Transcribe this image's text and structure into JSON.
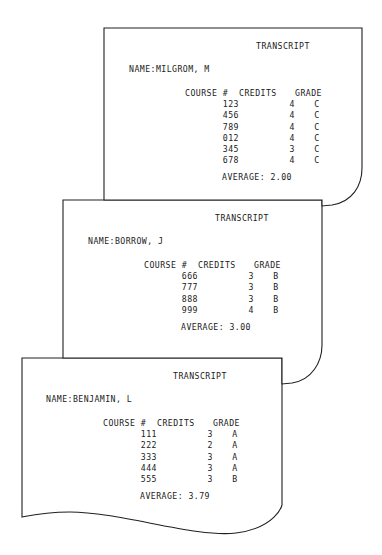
{
  "document": {
    "kind": "stacked-transcript-pages",
    "page_count": 3,
    "background_color": "#ffffff",
    "ink_color": "#202020"
  },
  "columns": {
    "course": "COURSE #",
    "course_label": "COURSE",
    "hash": "#",
    "credits": "CREDITS",
    "grade": "GRADE"
  },
  "labels": {
    "title": "TRANSCRIPT",
    "name_prefix": "NAME:",
    "average_prefix": "AVERAGE:"
  },
  "pages": [
    {
      "id": "transcript-milgrom",
      "title": "TRANSCRIPT",
      "name_line": "NAME:MILGROM, M",
      "student_name": "MILGROM, M",
      "headers": [
        "COURSE #",
        "CREDITS",
        "GRADE"
      ],
      "rows": [
        {
          "course": "123",
          "credits": "4",
          "grade": "C"
        },
        {
          "course": "456",
          "credits": "4",
          "grade": "C"
        },
        {
          "course": "789",
          "credits": "4",
          "grade": "C"
        },
        {
          "course": "012",
          "credits": "4",
          "grade": "C"
        },
        {
          "course": "345",
          "credits": "3",
          "grade": "C"
        },
        {
          "course": "678",
          "credits": "4",
          "grade": "C"
        }
      ],
      "average_line": "AVERAGE: 2.00",
      "average": "2.00"
    },
    {
      "id": "transcript-borrow",
      "title": "TRANSCRIPT",
      "name_line": "NAME:BORROW, J",
      "student_name": "BORROW, J",
      "headers": [
        "COURSE #",
        "CREDITS",
        "GRADE"
      ],
      "rows": [
        {
          "course": "666",
          "credits": "3",
          "grade": "B"
        },
        {
          "course": "777",
          "credits": "3",
          "grade": "B"
        },
        {
          "course": "888",
          "credits": "3",
          "grade": "B"
        },
        {
          "course": "999",
          "credits": "4",
          "grade": "B"
        }
      ],
      "average_line": "AVERAGE: 3.00",
      "average": "3.00"
    },
    {
      "id": "transcript-benjamin",
      "title": "TRANSCRIPT",
      "name_line": "NAME:BENJAMIN, L",
      "student_name": "BENJAMIN, L",
      "headers": [
        "COURSE #",
        "CREDITS",
        "GRADE"
      ],
      "rows": [
        {
          "course": "111",
          "credits": "3",
          "grade": "A"
        },
        {
          "course": "222",
          "credits": "2",
          "grade": "A"
        },
        {
          "course": "333",
          "credits": "3",
          "grade": "A"
        },
        {
          "course": "444",
          "credits": "3",
          "grade": "A"
        },
        {
          "course": "555",
          "credits": "3",
          "grade": "B"
        }
      ],
      "average_line": "AVERAGE: 3.79",
      "average": "3.79"
    }
  ]
}
